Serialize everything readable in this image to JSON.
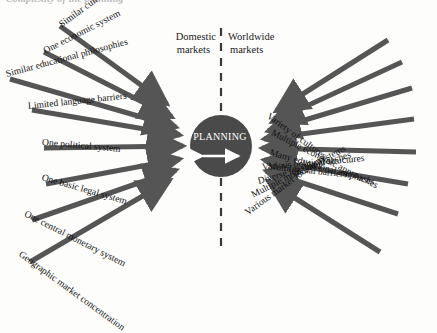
{
  "figure": {
    "clipped_heading": "Complexity of the planning",
    "center_node": "PLANNING",
    "divider": "dashed-vertical-line",
    "columns": {
      "left_line1": "Domestic",
      "left_line2": "markets",
      "right_line1": "Worldwide",
      "right_line2": "markets"
    },
    "colors": {
      "arrow": "#555555",
      "circle": "#4a4a4a",
      "circle_text": "#ffffff",
      "divider": "#3a3a3a",
      "background": "#fdfdfb",
      "text": "#101010"
    }
  },
  "domestic_factors": [
    {
      "label": "Similar cultural facets",
      "angle": 36,
      "x": 60,
      "y": 20,
      "len": 132
    },
    {
      "label": "One economic system",
      "angle": 27,
      "x": 44,
      "y": 46,
      "len": 136
    },
    {
      "label": "Similar educational philosophies",
      "angle": 15,
      "x": 6,
      "y": 69,
      "len": 172
    },
    {
      "label": "Limited language barriers",
      "angle": 6,
      "x": 28,
      "y": 101,
      "len": 148
    },
    {
      "label": "One political system",
      "angle": -5,
      "x": 42,
      "y": 137,
      "len": 140
    },
    {
      "label": "One basic legal system",
      "angle": -16,
      "x": 42,
      "y": 172,
      "len": 143
    },
    {
      "label": "One central monetary system",
      "angle": -27,
      "x": 25,
      "y": 208,
      "len": 160
    },
    {
      "label": "Geographic market concentration",
      "angle": -36,
      "x": 20,
      "y": 248,
      "len": 175
    }
  ],
  "worldwide_factors": [
    {
      "label": "Variety of cultures",
      "angle": -36,
      "x": 268,
      "y": 110,
      "len": 120
    },
    {
      "label": "Multiple economic approaches",
      "angle": -27,
      "x": 272,
      "y": 127,
      "len": 160
    },
    {
      "label": "Many educational emphases",
      "angle": -16,
      "x": 270,
      "y": 147,
      "len": 162
    },
    {
      "label": "Multilingual barriers",
      "angle": -6,
      "x": 268,
      "y": 161,
      "len": 155
    },
    {
      "label": "Various political structures",
      "angle": 5,
      "x": 262,
      "y": 162,
      "len": 160
    },
    {
      "label": "Diverse legal approaches",
      "angle": 16,
      "x": 258,
      "y": 176,
      "len": 158
    },
    {
      "label": "Multiple monetary systems",
      "angle": 27,
      "x": 252,
      "y": 190,
      "len": 162
    },
    {
      "label": "Various market locations",
      "angle": 36,
      "x": 246,
      "y": 208,
      "len": 165
    }
  ],
  "chart_data": {
    "type": "diagram",
    "title": "Complexity of the planning",
    "center": "PLANNING",
    "axis_split": [
      "Domestic markets",
      "Worldwide markets"
    ],
    "categories": [
      "cultural",
      "economic",
      "educational",
      "language",
      "political",
      "legal",
      "monetary",
      "market location"
    ],
    "series": [
      {
        "name": "Domestic markets",
        "values": [
          "Similar cultural facets",
          "One economic system",
          "Similar educational philosophies",
          "Limited language barriers",
          "One political system",
          "One basic legal system",
          "One central monetary system",
          "Geographic market concentration"
        ]
      },
      {
        "name": "Worldwide markets",
        "values": [
          "Variety of cultures",
          "Multiple economic approaches",
          "Many educational emphases",
          "Multilingual barriers",
          "Various political structures",
          "Diverse legal approaches",
          "Multiple monetary systems",
          "Various market locations"
        ]
      }
    ]
  }
}
